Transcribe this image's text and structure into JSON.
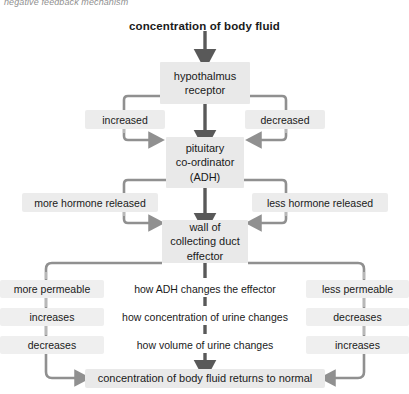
{
  "caption": "negative feedback mechanism",
  "colors": {
    "box_fill": "#e9e9e9",
    "chip_fill": "#ececec",
    "band_fill": "#efefef",
    "connector": "#8f8f8f",
    "arrow_dark": "#595959",
    "text": "#1a1a1a",
    "caption_text": "#8f8f8f",
    "page_bg": "#ffffff"
  },
  "nodes": {
    "stimulus": "concentration of body fluid",
    "receptor": "hypothalmus\nreceptor",
    "receptor_line1": "hypothalmus",
    "receptor_line2": "receptor",
    "coordinator_line1": "pituitary",
    "coordinator_line2": "co-ordinator",
    "coordinator_line3": "(ADH)",
    "effector_line1": "wall of",
    "effector_line2": "collecting duct",
    "effector_line3": "effector",
    "outcome": "concentration of body fluid returns to normal"
  },
  "branches": {
    "left_change": "increased",
    "right_change": "decreased",
    "left_hormone": "more hormone released",
    "right_hormone": "less hormone released"
  },
  "table": {
    "rows": [
      {
        "left": "more permeable",
        "middle": "how ADH changes the effector",
        "right": "less permeable"
      },
      {
        "left": "increases",
        "middle": "how concentration of urine changes",
        "right": "decreases"
      },
      {
        "left": "decreases",
        "middle": "how volume of urine changes",
        "right": "increases"
      }
    ]
  }
}
